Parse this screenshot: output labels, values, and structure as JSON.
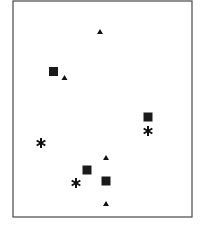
{
  "chart_data": {
    "type": "scatter",
    "title": "",
    "xlabel": "",
    "ylabel": "",
    "grid": false,
    "legend": null,
    "frame": {
      "left": 13,
      "top": 1,
      "right": 192,
      "bottom": 217,
      "color": "#555555"
    },
    "note": "Coordinates are pixel positions within the 202x228 image (no axes or tick labels shown)",
    "series": [
      {
        "name": "triangles",
        "marker": "triangle",
        "color": "#111111",
        "points": [
          [
            100,
            32
          ],
          [
            64.5,
            78
          ],
          [
            106,
            158
          ],
          [
            106,
            204
          ]
        ]
      },
      {
        "name": "squares",
        "marker": "square",
        "color": "#1a1a1a",
        "points": [
          [
            53.5,
            71.5
          ],
          [
            148,
            117
          ],
          [
            87,
            170
          ],
          [
            106,
            181
          ]
        ]
      },
      {
        "name": "asterisks",
        "marker": "asterisk",
        "color": "#111111",
        "points": [
          [
            148,
            131
          ],
          [
            41,
            143
          ],
          [
            76,
            183
          ]
        ]
      }
    ]
  }
}
